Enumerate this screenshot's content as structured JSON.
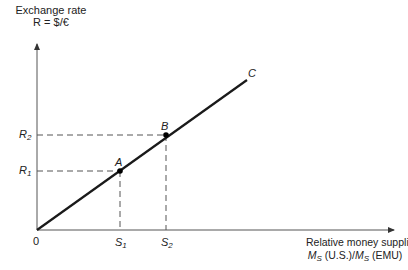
{
  "diagram": {
    "y_axis": {
      "title_line1": "Exchange rate",
      "title_line2": "R = $/€"
    },
    "x_axis": {
      "title_line1": "Relative money supplies",
      "title_line2_part1": "M",
      "title_line2_sub1": "S",
      "title_line2_part2": " (U.S.)/",
      "title_line2_part3": "M",
      "title_line2_sub2": "S",
      "title_line2_part4": " (EMU)"
    },
    "origin_label": "0",
    "y_ticks": [
      {
        "label": "R",
        "sub": "2"
      },
      {
        "label": "R",
        "sub": "1"
      }
    ],
    "x_ticks": [
      {
        "label": "S",
        "sub": "1"
      },
      {
        "label": "S",
        "sub": "2"
      }
    ],
    "points": [
      {
        "label": "A"
      },
      {
        "label": "B"
      },
      {
        "label": "C"
      }
    ],
    "colors": {
      "line": "#1a1a1a",
      "axis": "#444444",
      "dash": "#555555"
    }
  }
}
